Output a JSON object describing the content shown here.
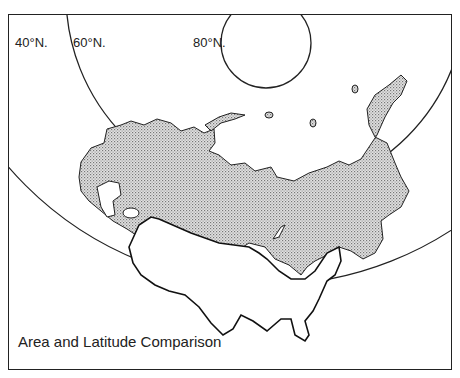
{
  "map": {
    "caption": "Area and Latitude Comparison",
    "latitude_labels": [
      {
        "label": "40°N.",
        "x": 14,
        "y": 18
      },
      {
        "label": "60°N.",
        "x": 72,
        "y": 18
      },
      {
        "label": "80°N.",
        "x": 186,
        "y": 18
      }
    ],
    "regions": [
      {
        "name": "USSR",
        "fill": "stippled gray"
      },
      {
        "name": "United States",
        "fill": "white outline"
      }
    ],
    "colors": {
      "line": "#222222",
      "stipple": "#bdbdbd",
      "background": "#ffffff"
    }
  }
}
